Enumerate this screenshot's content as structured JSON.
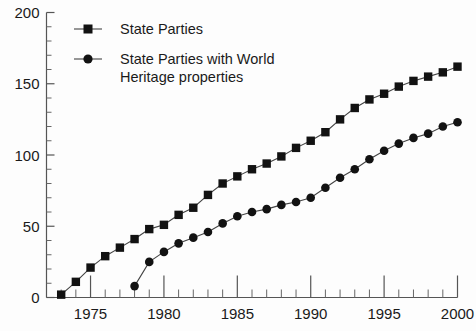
{
  "chart_data": {
    "type": "line",
    "title": "",
    "subtitle": "",
    "xlabel": "",
    "ylabel": "",
    "xlim": [
      1972,
      2000
    ],
    "ylim": [
      0,
      200
    ],
    "yticks": [
      0,
      50,
      100,
      150,
      200
    ],
    "ytick_labels": [
      "0",
      "50",
      "100",
      "150",
      "200"
    ],
    "y_minor_step": 10,
    "xticks": [
      1975,
      1980,
      1985,
      1990,
      1995,
      2000
    ],
    "xtick_labels": [
      "1975",
      "1980",
      "1985",
      "1990",
      "1995",
      "2000"
    ],
    "x_minor_step": 1,
    "grid": false,
    "legend_position": "top-center",
    "series": [
      {
        "name": "State Parties",
        "marker": "square",
        "color": "#121212",
        "x": [
          1973,
          1974,
          1975,
          1976,
          1977,
          1978,
          1979,
          1980,
          1981,
          1982,
          1983,
          1984,
          1985,
          1986,
          1987,
          1988,
          1989,
          1990,
          1991,
          1992,
          1993,
          1994,
          1995,
          1996,
          1997,
          1998,
          1999,
          2000
        ],
        "values": [
          2,
          11,
          21,
          29,
          35,
          41,
          48,
          51,
          58,
          63,
          72,
          80,
          85,
          90,
          94,
          99,
          105,
          110,
          116,
          125,
          133,
          139,
          143,
          148,
          152,
          155,
          158,
          162
        ]
      },
      {
        "name": "State Parties with World Heritage properties",
        "marker": "circle",
        "color": "#121212",
        "x": [
          1978,
          1979,
          1980,
          1981,
          1982,
          1983,
          1984,
          1985,
          1986,
          1987,
          1988,
          1989,
          1990,
          1991,
          1992,
          1993,
          1994,
          1995,
          1996,
          1997,
          1998,
          1999,
          2000
        ],
        "values": [
          8,
          25,
          32,
          38,
          42,
          46,
          52,
          57,
          60,
          62,
          65,
          67,
          70,
          77,
          84,
          90,
          97,
          103,
          108,
          112,
          115,
          120,
          123
        ]
      }
    ],
    "legend": [
      {
        "label_lines": [
          "State Parties"
        ],
        "marker": "square"
      },
      {
        "label_lines": [
          "State Parties with World",
          "Heritage properties"
        ],
        "marker": "circle"
      }
    ],
    "colors": {
      "background": "#fdfdfd",
      "axis": "#555555",
      "marker": "#121212",
      "line": "#444444",
      "text": "#1a1a1a"
    }
  }
}
